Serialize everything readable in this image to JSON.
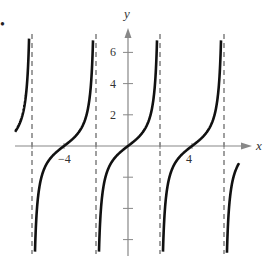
{
  "chart_data": {
    "type": "line",
    "title": "",
    "function": "y = tan(pi*x/4)",
    "xlabel": "x",
    "ylabel": "y",
    "xlim": [
      -7.1,
      7.5
    ],
    "ylim": [
      -7,
      7.5
    ],
    "x_tick_labels": [
      {
        "value": -4,
        "label": "−4"
      },
      {
        "value": 4,
        "label": "4"
      }
    ],
    "y_tick_labels": [
      {
        "value": 2,
        "label": "2"
      },
      {
        "value": 4,
        "label": "4"
      },
      {
        "value": 6,
        "label": "6"
      }
    ],
    "y_ticks_unlabeled": [
      -2,
      -4,
      -6
    ],
    "asymptotes": [
      -6,
      -2,
      2,
      6
    ],
    "zeros": [
      -4,
      0,
      4
    ],
    "period": 4,
    "domain_shown": [
      -7.06,
      6.94
    ],
    "grid": false,
    "legend": null
  },
  "bullet": "•",
  "colors": {
    "curve": "#111111",
    "axis": "#888888",
    "asymptote": "#777777"
  }
}
